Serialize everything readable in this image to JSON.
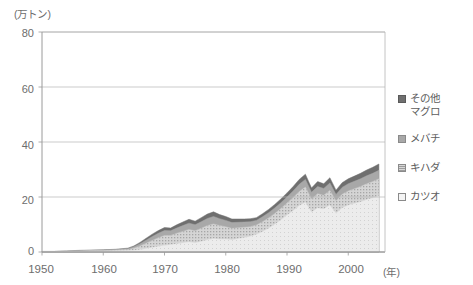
{
  "chart_data": {
    "type": "area",
    "title": "",
    "subtitle": "",
    "ylabel": "(万トン)",
    "xlabel": "(年)",
    "ylim": [
      0,
      80
    ],
    "xlim": [
      1950,
      2006
    ],
    "yticks": [
      0,
      20,
      40,
      60,
      80
    ],
    "xticks": [
      1950,
      1960,
      1970,
      1980,
      1990,
      2000
    ],
    "grid": true,
    "stacked": true,
    "legend_position": "right",
    "x": [
      1950,
      1952,
      1954,
      1956,
      1958,
      1960,
      1962,
      1964,
      1965,
      1966,
      1967,
      1968,
      1969,
      1970,
      1971,
      1972,
      1973,
      1974,
      1975,
      1976,
      1977,
      1978,
      1979,
      1980,
      1981,
      1982,
      1983,
      1984,
      1985,
      1986,
      1987,
      1988,
      1989,
      1990,
      1991,
      1992,
      1993,
      1994,
      1995,
      1996,
      1997,
      1998,
      1999,
      2000,
      2001,
      2002,
      2003,
      2004,
      2005
    ],
    "series": [
      {
        "name": "カツオ",
        "key": "katsuo",
        "color": "#e9e9e9",
        "pattern": "solid-light",
        "values": [
          0.1,
          0.1,
          0.2,
          0.2,
          0.3,
          0.3,
          0.4,
          0.5,
          0.6,
          0.8,
          1.2,
          1.6,
          2.0,
          2.4,
          2.6,
          3.0,
          3.3,
          3.6,
          3.3,
          3.8,
          4.4,
          4.8,
          4.6,
          4.6,
          4.4,
          4.8,
          5.2,
          5.6,
          6.4,
          7.4,
          8.6,
          10.0,
          11.6,
          13.4,
          15.0,
          16.8,
          18.0,
          14.5,
          16.0,
          15.6,
          17.0,
          14.0,
          16.0,
          17.0,
          17.6,
          18.2,
          19.0,
          19.6,
          20.4
        ]
      },
      {
        "name": "キハダ",
        "key": "kihada",
        "color": "#c8c8c8",
        "pattern": "hatch",
        "values": [
          0.1,
          0.1,
          0.1,
          0.2,
          0.2,
          0.2,
          0.3,
          0.4,
          0.8,
          1.4,
          2.0,
          2.6,
          3.2,
          3.6,
          3.4,
          3.8,
          4.2,
          4.6,
          4.4,
          4.8,
          5.2,
          5.4,
          5.0,
          4.6,
          4.2,
          4.0,
          3.8,
          3.6,
          3.4,
          3.6,
          3.8,
          4.0,
          4.2,
          4.4,
          4.8,
          5.2,
          5.6,
          4.8,
          5.2,
          5.0,
          5.4,
          4.6,
          5.0,
          5.2,
          5.4,
          5.6,
          5.8,
          6.0,
          6.2
        ]
      },
      {
        "name": "メバチ",
        "key": "mebachi",
        "color": "#a8a8a8",
        "pattern": "solid-mid",
        "values": [
          0.0,
          0.0,
          0.1,
          0.1,
          0.1,
          0.2,
          0.2,
          0.3,
          0.5,
          0.8,
          1.1,
          1.4,
          1.6,
          1.8,
          1.7,
          1.9,
          2.1,
          2.3,
          2.2,
          2.4,
          2.6,
          2.7,
          2.5,
          2.3,
          2.1,
          2.0,
          1.9,
          1.8,
          1.7,
          1.8,
          1.9,
          2.0,
          2.1,
          2.2,
          2.4,
          2.6,
          2.8,
          2.4,
          2.6,
          2.5,
          2.7,
          2.3,
          2.5,
          2.6,
          2.7,
          2.8,
          2.9,
          3.0,
          3.1
        ]
      },
      {
        "name": "その他マグロ",
        "key": "sonota-maguro",
        "color": "#6f6f6f",
        "pattern": "solid-dark",
        "values": [
          0.0,
          0.0,
          0.0,
          0.1,
          0.1,
          0.1,
          0.1,
          0.2,
          0.3,
          0.5,
          0.7,
          0.9,
          1.0,
          1.1,
          1.0,
          1.2,
          1.3,
          1.4,
          1.3,
          1.5,
          1.6,
          1.7,
          1.5,
          1.4,
          1.3,
          1.2,
          1.1,
          1.1,
          1.0,
          1.1,
          1.2,
          1.3,
          1.4,
          1.5,
          1.6,
          1.8,
          1.9,
          1.6,
          1.8,
          1.7,
          1.9,
          1.6,
          1.7,
          1.8,
          1.9,
          2.0,
          2.1,
          2.2,
          2.3
        ]
      }
    ],
    "legend_entries": [
      {
        "label": "その他\nマグロ",
        "swatch": "#6f6f6f"
      },
      {
        "label": "メバチ",
        "swatch": "#a8a8a8"
      },
      {
        "label": "キハダ",
        "swatch": "#c8c8c8"
      },
      {
        "label": "カツオ",
        "swatch": "#f2f2f2"
      }
    ]
  },
  "axes": {
    "y_unit": "(万トン)",
    "x_unit": "(年)",
    "y_tick_labels": [
      "80",
      "60",
      "40",
      "20",
      "0"
    ],
    "x_tick_labels": [
      "1950",
      "1960",
      "1970",
      "1980",
      "1990",
      "2000"
    ]
  },
  "colors": {
    "axis": "#9a9a9a",
    "grid": "#b5b5b5",
    "text": "#5d5d5d",
    "background": "#ffffff"
  }
}
